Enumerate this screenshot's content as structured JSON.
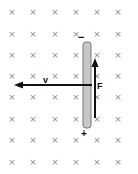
{
  "diagram": {
    "field": {
      "symbol": "×",
      "direction": "into page",
      "columns_x": [
        12,
        33,
        55,
        76,
        97,
        118
      ],
      "rows_y": [
        12,
        34,
        55,
        76,
        97,
        119,
        140,
        162
      ],
      "color": "#8a8a8a"
    },
    "rod": {
      "x": 83,
      "y": 42,
      "width": 8,
      "height": 86,
      "fill": "#c8c8c8",
      "stroke": "#777777",
      "top_charge": "−",
      "bottom_charge": "+"
    },
    "velocity": {
      "label": "v",
      "direction": "left",
      "x1": 92,
      "x2": 14,
      "y": 85
    },
    "force": {
      "label": "F",
      "direction": "up",
      "x": 95,
      "y1": 118,
      "y2": 58
    }
  }
}
